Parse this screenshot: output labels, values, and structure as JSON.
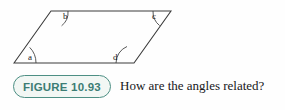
{
  "figure": {
    "badge_label": "FIGURE 10.93",
    "caption": "How are the angles related?",
    "badge_border_color": "#4d8f84",
    "badge_text_color": "#3d7d74",
    "badge_fill_color": "#f2f7f4",
    "stroke_color": "#3a3a3a",
    "background_color": "#fefefe"
  },
  "diagram": {
    "type": "parallelogram",
    "vertices": [
      {
        "name": "bottom-left",
        "x": 14,
        "y": 63
      },
      {
        "name": "top-left",
        "x": 51,
        "y": 11
      },
      {
        "name": "top-right",
        "x": 171,
        "y": 11
      },
      {
        "name": "bottom-right",
        "x": 134,
        "y": 63
      }
    ],
    "angles": [
      {
        "label": "a",
        "vertex": "bottom-left",
        "label_x": 29,
        "label_y": 55
      },
      {
        "label": "b",
        "vertex": "top-left",
        "label_x": 64,
        "label_y": 15
      },
      {
        "label": "c",
        "vertex": "top-right",
        "label_x": 152,
        "label_y": 15
      },
      {
        "label": "d",
        "vertex": "bottom-right",
        "label_x": 114,
        "label_y": 55
      }
    ]
  }
}
